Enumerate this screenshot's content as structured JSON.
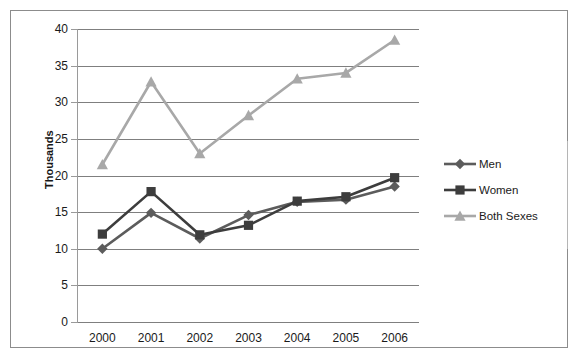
{
  "chart_data": {
    "type": "line",
    "title": "",
    "xlabel": "",
    "ylabel": "Thousands",
    "categories": [
      "2000",
      "2001",
      "2002",
      "2003",
      "2004",
      "2005",
      "2006"
    ],
    "ylim": [
      0,
      40
    ],
    "ytick_values": [
      0,
      5,
      10,
      15,
      20,
      25,
      30,
      35,
      40
    ],
    "ytick_labels": [
      "0",
      "5",
      "10",
      "15",
      "20",
      "25",
      "30",
      "35",
      "40"
    ],
    "grid": "horizontal",
    "legend_position": "right",
    "series": [
      {
        "name": "Men",
        "marker": "diamond",
        "color": "#5c5c5c",
        "values": [
          10.0,
          14.9,
          11.4,
          14.6,
          16.4,
          16.7,
          18.5
        ]
      },
      {
        "name": "Women",
        "marker": "square",
        "color": "#3d3d3d",
        "values": [
          12.0,
          17.8,
          11.9,
          13.2,
          16.5,
          17.1,
          19.7
        ]
      },
      {
        "name": "Both Sexes",
        "marker": "triangle",
        "color": "#a8a8a8",
        "values": [
          21.5,
          32.8,
          23.0,
          28.2,
          33.2,
          34.0,
          38.5
        ]
      }
    ]
  }
}
